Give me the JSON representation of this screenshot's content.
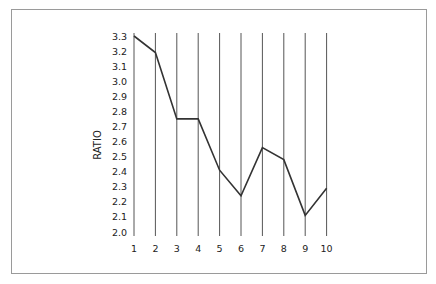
{
  "chart_data": {
    "type": "line",
    "title": "",
    "xlabel": "",
    "ylabel": "RATIO",
    "categories": [
      "1",
      "2",
      "3",
      "4",
      "5",
      "6",
      "7",
      "8",
      "9",
      "10"
    ],
    "x": [
      1,
      2,
      3,
      4,
      5,
      6,
      7,
      8,
      9,
      10
    ],
    "series": [
      {
        "name": "Ratio",
        "values": [
          3.3,
          3.19,
          2.75,
          2.75,
          2.41,
          2.24,
          2.56,
          2.48,
          2.11,
          2.29
        ]
      }
    ],
    "ylim": [
      2.0,
      3.3
    ],
    "yticks": [
      "2.0",
      "2.1",
      "2.2",
      "2.3",
      "2.4",
      "2.5",
      "2.6",
      "2.7",
      "2.8",
      "2.9",
      "3.0",
      "3.1",
      "3.2",
      "3.3"
    ],
    "grid": "vertical lines at each x category",
    "legend": "none",
    "colors": {
      "line": "#333333",
      "grid": "#555555",
      "frame": "#9a9a9a"
    }
  }
}
